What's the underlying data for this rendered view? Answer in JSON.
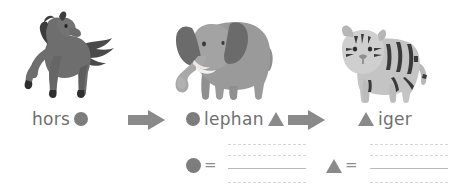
{
  "page": {
    "type": "phonics-rebus-worksheet",
    "background": "#ffffff",
    "text_color": "#6f6f6f",
    "symbol_color": "#7d7d7d",
    "arrow_color": "#8a8a8a",
    "rule_dotted_color": "#d6d6d6",
    "rule_solid_color": "#b9b9b9"
  },
  "items": [
    {
      "id": "horse",
      "picture": "horse-illustration",
      "word_parts": [
        {
          "kind": "text",
          "value": "hors"
        },
        {
          "kind": "symbol",
          "value": "circle"
        }
      ]
    },
    {
      "id": "elephant",
      "picture": "elephant-illustration",
      "word_parts": [
        {
          "kind": "symbol",
          "value": "circle"
        },
        {
          "kind": "text",
          "value": "lephan"
        },
        {
          "kind": "symbol",
          "value": "triangle"
        }
      ]
    },
    {
      "id": "tiger",
      "picture": "tiger-illustration",
      "word_parts": [
        {
          "kind": "symbol",
          "value": "triangle"
        },
        {
          "kind": "text",
          "value": "iger"
        }
      ]
    }
  ],
  "labels": {
    "horse_text": "hors",
    "elephant_text": "lephan",
    "tiger_text": "iger",
    "equals": "="
  },
  "arrows": [
    {
      "id": "arrow-1",
      "direction": "right"
    },
    {
      "id": "arrow-2",
      "direction": "right"
    }
  ],
  "answers": [
    {
      "id": "circle-answer",
      "symbol": "circle",
      "equals": "=",
      "value": "",
      "rules": [
        "dotted",
        "dotted",
        "solid",
        "dotted"
      ]
    },
    {
      "id": "triangle-answer",
      "symbol": "triangle",
      "equals": "=",
      "value": "",
      "rules": [
        "dotted",
        "dotted",
        "solid",
        "dotted"
      ]
    }
  ],
  "icons": {
    "circle": "circle-symbol",
    "triangle": "triangle-symbol",
    "arrow": "arrow-right-icon"
  }
}
